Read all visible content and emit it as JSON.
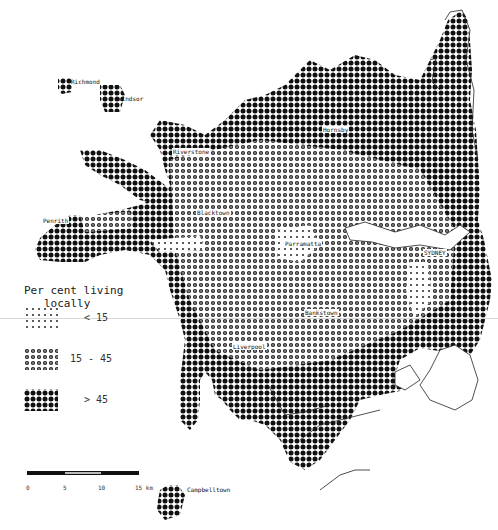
{
  "legend": {
    "title_line1": "Per cent living",
    "title_line2": "locally",
    "items": [
      {
        "label": "< 15",
        "class": "low",
        "dot_size": 1.2
      },
      {
        "label": "15 - 45",
        "class": "mid",
        "dot_size": 2.2
      },
      {
        "label": "> 45",
        "class": "high",
        "dot_size": 3.0
      }
    ]
  },
  "scale": {
    "ticks": [
      "0",
      "5",
      "10",
      "15 km"
    ],
    "unit": "km"
  },
  "places": [
    {
      "name": "Richmond",
      "x": 70,
      "y": 79
    },
    {
      "name": "Windsor",
      "x": 117,
      "y": 96
    },
    {
      "name": "Riverstone",
      "x": 172,
      "y": 149
    },
    {
      "name": "Hornsby",
      "x": 324,
      "y": 127
    },
    {
      "name": "Penrith",
      "x": 42,
      "y": 218
    },
    {
      "name": "Blacktown",
      "x": 196,
      "y": 210
    },
    {
      "name": "Parramatta",
      "x": 285,
      "y": 241
    },
    {
      "name": "SYDNEY",
      "x": 424,
      "y": 250
    },
    {
      "name": "Bankstown",
      "x": 305,
      "y": 310
    },
    {
      "name": "Liverpool",
      "x": 232,
      "y": 344
    },
    {
      "name": "Campbelltown",
      "x": 186,
      "y": 486
    }
  ],
  "colors": {
    "dot": "#111111",
    "coast": "#222222",
    "background": "#ffffff"
  },
  "grid": {
    "cell": 6
  }
}
